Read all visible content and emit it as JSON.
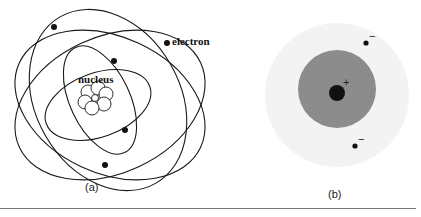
{
  "panel_a": {
    "caption": "(a)",
    "label_nucleus": "nucleus",
    "label_electron": "electron",
    "title": "Bohr/Rutherford planetary atom model"
  },
  "panel_b": {
    "caption": "(b)",
    "nucleus_charge": "+",
    "electron_charge_1": "−",
    "electron_charge_2": "−",
    "colors": {
      "outer_cloud": "#f3f3f3",
      "inner_cloud": "#8c8c8c",
      "nucleus": "#111111"
    }
  },
  "colors": {
    "line": "#1a1a1a",
    "background": "#ffffff"
  }
}
